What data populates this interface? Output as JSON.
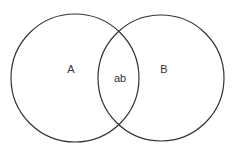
{
  "diagram": {
    "type": "venn",
    "sets": [
      {
        "label": "A",
        "cx": 75,
        "cy": 78,
        "r": 64
      },
      {
        "label": "B",
        "cx": 161,
        "cy": 78,
        "r": 63
      }
    ],
    "intersection": {
      "label": "ab"
    },
    "stroke_color": "#333333",
    "background": "#ffffff"
  }
}
